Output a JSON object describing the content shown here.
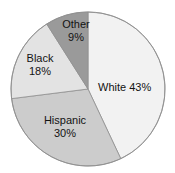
{
  "title_sliver": "U.S. POPULATION BY RACE AND ETHNICITY",
  "chart_data": {
    "type": "pie",
    "title": "",
    "categories": [
      "White",
      "Hispanic",
      "Black",
      "Other"
    ],
    "values": [
      43,
      30,
      18,
      9
    ],
    "value_unit": "%",
    "labels": [
      {
        "name": "White",
        "value": 43,
        "text": "White 43%",
        "percent_text": "43%",
        "color": "#f2f2f2",
        "label_layout": "inline"
      },
      {
        "name": "Hispanic",
        "value": 30,
        "text": "Hispanic",
        "percent_text": "30%",
        "color": "#cccccc",
        "label_layout": "stacked"
      },
      {
        "name": "Black",
        "value": 18,
        "text": "Black",
        "percent_text": "18%",
        "color": "#e3e3e3",
        "label_layout": "stacked"
      },
      {
        "name": "Other",
        "value": 9,
        "text": "Other",
        "percent_text": "9%",
        "color": "#9a9a9a",
        "label_layout": "stacked"
      }
    ],
    "start_angle_deg": 0,
    "direction": "clockwise",
    "legend": "none",
    "grid": false,
    "outline_color": "#8f8f8f",
    "background": "#ffffff"
  },
  "geometry": {
    "center_x": 88,
    "center_y": 89,
    "radius": 77
  }
}
